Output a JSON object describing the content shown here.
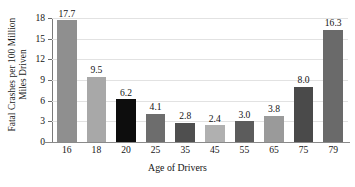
{
  "chart_data": {
    "type": "bar",
    "title": "",
    "xlabel": "Age of Drivers",
    "ylabel_line1": "Fatal Crashes per 100 Million",
    "ylabel_line2": "Miles Driven",
    "categories": [
      "16",
      "18",
      "20",
      "25",
      "35",
      "45",
      "55",
      "65",
      "75",
      "79"
    ],
    "values": [
      17.7,
      9.5,
      6.2,
      4.1,
      2.8,
      2.4,
      3.0,
      3.8,
      8.0,
      16.3
    ],
    "value_labels": [
      "17.7",
      "9.5",
      "6.2",
      "4.1",
      "2.8",
      "2.4",
      "3.0",
      "3.8",
      "8.0",
      "16.3"
    ],
    "bar_colors": [
      "#8f8f8f",
      "#a8a8a8",
      "#0d0d0d",
      "#6d6d6d",
      "#4f4f4f",
      "#b0b0b0",
      "#5c5c5c",
      "#9a9a9a",
      "#4a4a4a",
      "#6a6a6a"
    ],
    "ylim": [
      0,
      18
    ],
    "yticks": [
      0,
      3,
      6,
      9,
      12,
      15,
      18
    ],
    "ytick_labels": [
      "0",
      "3",
      "6",
      "9",
      "12",
      "15",
      "18"
    ],
    "grid": true,
    "legend": "none",
    "axis_color": "#8a8a8a",
    "grid_color": "#e2e2e2",
    "background": "#ffffff"
  }
}
